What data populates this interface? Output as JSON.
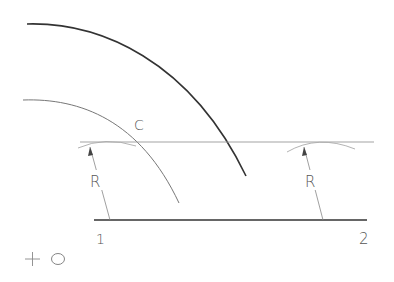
{
  "diagram": {
    "labels": {
      "arc_label": "C",
      "radius_left": "R",
      "radius_right": "R",
      "point_1": "1",
      "point_2": "2",
      "center_cross": "+",
      "center_label": "O"
    },
    "colors": {
      "heavy_line": "#333333",
      "thin_line": "#888888",
      "construction_line": "#aaaaaa",
      "text": "#555555"
    }
  }
}
